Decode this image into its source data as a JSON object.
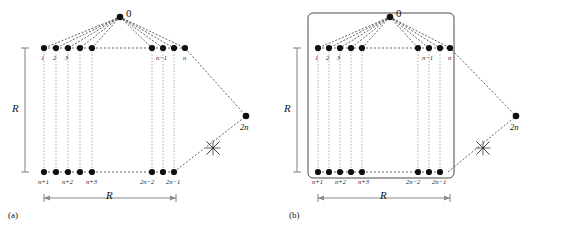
{
  "figure": {
    "panels": [
      {
        "id": "a",
        "caption": "(a)",
        "boxed": false,
        "apex_label": "0",
        "vertical_scale_label": "R",
        "horizontal_scale_label": "R",
        "top_row_labels_left": [
          "1",
          "2",
          "3"
        ],
        "top_row_labels_right": [
          "n−1",
          "n"
        ],
        "bottom_row_labels_left": [
          "n+1",
          "n+2",
          "n+3"
        ],
        "bottom_row_labels_right": [
          "2n−2",
          "2n−1"
        ],
        "far_node_label": "2n",
        "cross_mark": "x-cross-mark"
      },
      {
        "id": "b",
        "caption": "(b)",
        "boxed": true,
        "apex_label": "0",
        "vertical_scale_label": "R",
        "horizontal_scale_label": "R",
        "top_row_labels_left": [
          "1",
          "2",
          "3"
        ],
        "top_row_labels_right": [
          "n−1",
          "n"
        ],
        "bottom_row_labels_left": [
          "n+1",
          "n+2",
          "n+3"
        ],
        "bottom_row_labels_right": [
          "2n−2",
          "2n−1"
        ],
        "far_node_label": "2n",
        "cross_mark": "x-cross-mark"
      }
    ],
    "colors": {
      "node": "#101010",
      "edge_dashed": "#3a3a3a",
      "vertical_dotted": "#9a9a9a",
      "scale_bar": "#8a8a8a",
      "box_border": "#4a4a4a",
      "background": "#ffffff",
      "text": "#141414"
    },
    "geometry": {
      "node_radius": 3.1,
      "top_row_y": 48,
      "bottom_row_y": 172,
      "apex_y": 17
    }
  }
}
